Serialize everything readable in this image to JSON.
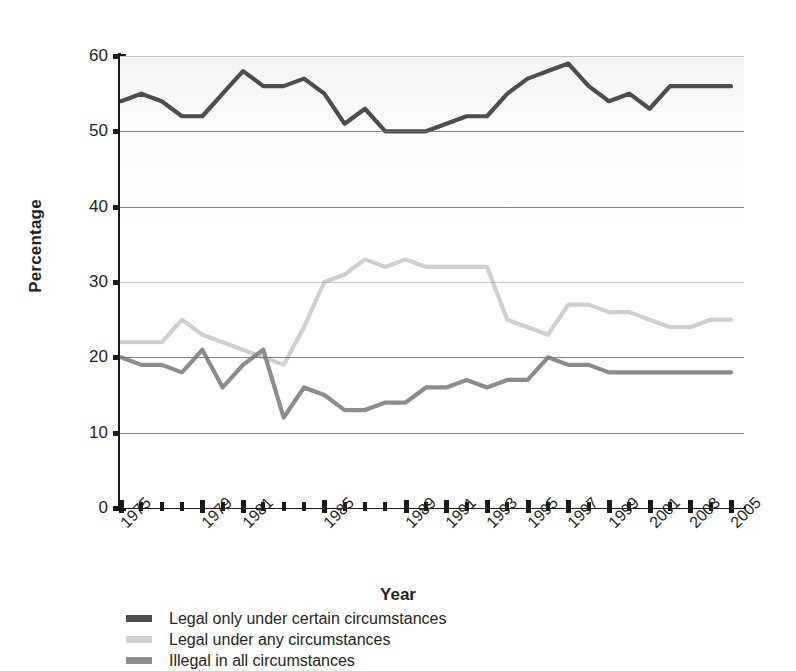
{
  "axes": {
    "ylabel": "Percentage",
    "xlabel": "Year",
    "yticks": [
      "0",
      "10",
      "20",
      "30",
      "40",
      "50",
      "60"
    ],
    "xticklabels": [
      "1975",
      "1979",
      "1981",
      "1985",
      "1989",
      "1991",
      "1993",
      "1995",
      "1997",
      "1999",
      "2001",
      "2003",
      "2005"
    ]
  },
  "legend": {
    "items": [
      {
        "label": "Legal only under certain circumstances",
        "color": "#4d4d4d"
      },
      {
        "label": "Legal under any circumstances",
        "color": "#cfcfcf"
      },
      {
        "label": "Illegal in all circumstances",
        "color": "#8c8c8c"
      }
    ]
  },
  "chart_data": {
    "type": "line",
    "title": "",
    "xlabel": "Year",
    "ylabel": "Percentage",
    "ylim": [
      0,
      60
    ],
    "xlim": [
      1975,
      2005
    ],
    "grid": true,
    "legend_position": "below",
    "x": [
      1975,
      1976,
      1977,
      1978,
      1979,
      1980,
      1981,
      1982,
      1983,
      1984,
      1985,
      1986,
      1987,
      1988,
      1989,
      1990,
      1991,
      1992,
      1993,
      1994,
      1995,
      1996,
      1997,
      1998,
      1999,
      2000,
      2001,
      2002,
      2003,
      2004,
      2005
    ],
    "series": [
      {
        "name": "Legal only under certain circumstances",
        "color": "#4d4d4d",
        "values": [
          54,
          55,
          54,
          52,
          52,
          55,
          58,
          56,
          56,
          57,
          55,
          51,
          53,
          50,
          50,
          50,
          51,
          52,
          52,
          55,
          57,
          58,
          59,
          56,
          54,
          55,
          53,
          56,
          56,
          56,
          56
        ]
      },
      {
        "name": "Legal under any circumstances",
        "color": "#cfcfcf",
        "values": [
          22,
          22,
          22,
          25,
          23,
          22,
          21,
          20,
          19,
          24,
          30,
          31,
          33,
          32,
          33,
          32,
          32,
          32,
          32,
          25,
          24,
          23,
          27,
          27,
          26,
          26,
          25,
          24,
          24,
          25,
          25
        ]
      },
      {
        "name": "Illegal in all circumstances",
        "color": "#8c8c8c",
        "values": [
          20,
          19,
          19,
          18,
          21,
          16,
          19,
          21,
          12,
          16,
          15,
          13,
          13,
          14,
          14,
          16,
          16,
          17,
          16,
          17,
          17,
          20,
          19,
          19,
          18,
          18,
          18,
          18,
          18,
          18,
          18
        ]
      }
    ]
  }
}
